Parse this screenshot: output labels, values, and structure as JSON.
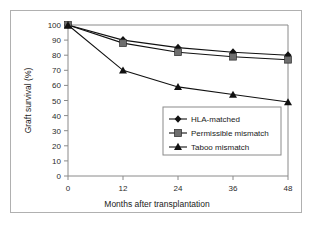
{
  "chart_data": {
    "type": "line",
    "title": "",
    "xlabel": "Months after transplantation",
    "ylabel": "Graft survival (%)",
    "x": [
      0,
      12,
      24,
      36,
      48
    ],
    "xticks": [
      "0",
      "12",
      "24",
      "36",
      "48"
    ],
    "yticks": [
      "0",
      "10",
      "20",
      "30",
      "40",
      "50",
      "60",
      "70",
      "80",
      "90",
      "100"
    ],
    "xlim": [
      0,
      48
    ],
    "ylim": [
      0,
      100
    ],
    "grid": false,
    "legend_position": "center-right",
    "series": [
      {
        "name": "HLA-matched",
        "marker": "diamond",
        "color": "#111111",
        "values": [
          100,
          90,
          85,
          82,
          80
        ]
      },
      {
        "name": "Permissible mismatch",
        "marker": "square",
        "color": "#6e6e6e",
        "values": [
          100,
          88,
          82,
          79,
          77
        ]
      },
      {
        "name": "Taboo mismatch",
        "marker": "triangle",
        "color": "#111111",
        "values": [
          100,
          70,
          59,
          54,
          49
        ]
      }
    ]
  }
}
